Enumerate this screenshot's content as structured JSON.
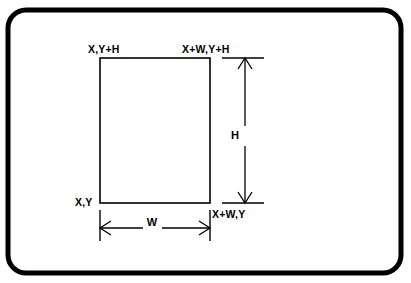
{
  "figure": {
    "background_color": "#ffffff",
    "line_color": "#000000",
    "frame": {
      "name": "rounded-border-frame",
      "x": 8,
      "y": 10,
      "width": 393,
      "height": 263,
      "corner_radius": 18,
      "stroke_width": 5
    },
    "rectangle": {
      "name": "coordinate-rectangle",
      "left": 100,
      "top": 58,
      "right": 210,
      "bottom": 203,
      "stroke_width": 1.6
    },
    "corner_labels": [
      {
        "id": "bottom-left",
        "text": "X,Y",
        "x": 75,
        "y": 206,
        "anchor": "start"
      },
      {
        "id": "top-left",
        "text": "X,Y+H",
        "x": 88,
        "y": 53,
        "anchor": "start"
      },
      {
        "id": "top-right",
        "text": "X+W,Y+H",
        "x": 182,
        "y": 53,
        "anchor": "start"
      },
      {
        "id": "bottom-right",
        "text": "X+W,Y",
        "x": 212,
        "y": 218,
        "anchor": "start"
      }
    ],
    "dimensions": [
      {
        "id": "width-dimension",
        "label": "W",
        "orientation": "horizontal",
        "label_x": 152,
        "label_y": 226,
        "line_y": 228,
        "from": 100,
        "to": 210,
        "extension_from": 210,
        "extension_to": 242,
        "gap_start": 143,
        "gap_end": 162
      },
      {
        "id": "height-dimension",
        "label": "H",
        "orientation": "vertical",
        "label_x": 235,
        "label_y": 139,
        "line_x": 245,
        "from": 58,
        "to": 203,
        "extension_from": 222,
        "extension_to": 264,
        "gap_start": 126,
        "gap_end": 146
      }
    ]
  }
}
